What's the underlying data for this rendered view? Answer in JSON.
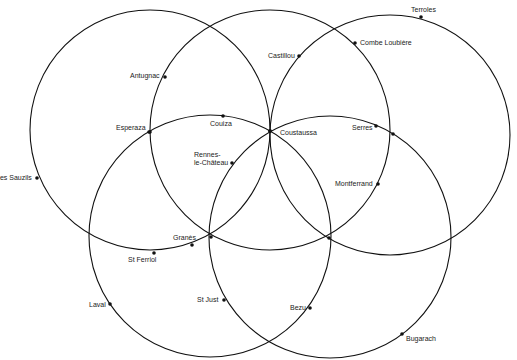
{
  "diagram": {
    "title_fragment": "g  p",
    "stroke_color": "#111111",
    "circles": [
      {
        "id": "upper-left",
        "cx": 150,
        "cy": 130,
        "r": 120
      },
      {
        "id": "upper-middle",
        "cx": 270,
        "cy": 130,
        "r": 120
      },
      {
        "id": "upper-right",
        "cx": 390,
        "cy": 135,
        "r": 120
      },
      {
        "id": "lower-left",
        "cx": 210,
        "cy": 236,
        "r": 121
      },
      {
        "id": "lower-right",
        "cx": 330,
        "cy": 237,
        "r": 121
      }
    ],
    "places": [
      {
        "name": "Terroles",
        "x": 421,
        "y": 17,
        "lx": 411,
        "ly": 6,
        "anchor": "left"
      },
      {
        "name": "Combe Loubière",
        "x": 355,
        "y": 43,
        "lx": 360,
        "ly": 39,
        "anchor": "left"
      },
      {
        "name": "Castillou",
        "x": 299,
        "y": 56,
        "lx": 268,
        "ly": 52,
        "anchor": "left"
      },
      {
        "name": "Antugnac",
        "x": 165,
        "y": 77,
        "lx": 130,
        "ly": 72,
        "anchor": "left"
      },
      {
        "name": "Esperaza",
        "x": 149,
        "y": 132,
        "lx": 116,
        "ly": 124,
        "anchor": "left"
      },
      {
        "name": "Couiza",
        "x": 223,
        "y": 116,
        "lx": 210,
        "ly": 120,
        "anchor": "left"
      },
      {
        "name": "Coustaussa",
        "x": 270,
        "y": 131,
        "lx": 280,
        "ly": 129,
        "anchor": "left"
      },
      {
        "name": "Serres",
        "x": 376,
        "y": 126,
        "lx": 352,
        "ly": 124,
        "anchor": "left"
      },
      {
        "name": "Rennes-\nle-Château",
        "x": 232,
        "y": 163,
        "lx": 194,
        "ly": 151,
        "anchor": "left"
      },
      {
        "name": "Les Sauzils",
        "x": 37,
        "y": 178,
        "lx": -4,
        "ly": 174,
        "anchor": "left"
      },
      {
        "name": "Montferrand",
        "x": 378,
        "y": 184,
        "lx": 335,
        "ly": 180,
        "anchor": "left"
      },
      {
        "name": "Granès",
        "x": 192,
        "y": 245,
        "lx": 173,
        "ly": 234,
        "anchor": "left"
      },
      {
        "name": "St Ferriol",
        "x": 154,
        "y": 253,
        "lx": 128,
        "ly": 256,
        "anchor": "left"
      },
      {
        "name": "Laval",
        "x": 110,
        "y": 304,
        "lx": 89,
        "ly": 301,
        "anchor": "left"
      },
      {
        "name": "St Just",
        "x": 224,
        "y": 300,
        "lx": 197,
        "ly": 296,
        "anchor": "left"
      },
      {
        "name": "Bezu",
        "x": 310,
        "y": 308,
        "lx": 290,
        "ly": 304,
        "anchor": "left"
      },
      {
        "name": "Bugarach",
        "x": 402,
        "y": 334,
        "lx": 406,
        "ly": 335,
        "anchor": "left"
      }
    ],
    "junctions": [
      {
        "x": 270,
        "y": 131
      },
      {
        "x": 211,
        "y": 237
      },
      {
        "x": 329,
        "y": 238
      },
      {
        "x": 150,
        "y": 132
      },
      {
        "x": 393,
        "y": 134
      }
    ]
  }
}
